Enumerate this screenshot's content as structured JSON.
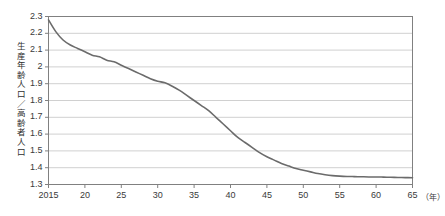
{
  "chart_data": {
    "type": "line",
    "title": "",
    "xlabel": "",
    "ylabel": "生産年齢人口／高齢者人口",
    "x_unit": "（年）",
    "xlim": [
      2015,
      2065
    ],
    "ylim": [
      1.3,
      2.3
    ],
    "grid": true,
    "legend": "none",
    "x_tick_labels": [
      "2015",
      "20",
      "25",
      "30",
      "35",
      "40",
      "45",
      "50",
      "55",
      "60",
      "65"
    ],
    "x_tick_values": [
      2015,
      2020,
      2025,
      2030,
      2035,
      2040,
      2045,
      2050,
      2055,
      2060,
      2065
    ],
    "y_tick_labels": [
      "1.3",
      "1.4",
      "1.5",
      "1.6",
      "1.7",
      "1.8",
      "1.9",
      "2",
      "2.1",
      "2.2",
      "2.3"
    ],
    "y_tick_values": [
      1.3,
      1.4,
      1.5,
      1.6,
      1.7,
      1.8,
      1.9,
      2.0,
      2.1,
      2.2,
      2.3
    ],
    "series": [
      {
        "name": "生産年齢人口／高齢者人口",
        "color": "#6b6b6b",
        "x": [
          2015,
          2016,
          2017,
          2018,
          2019,
          2020,
          2021,
          2022,
          2023,
          2024,
          2025,
          2026,
          2027,
          2028,
          2029,
          2030,
          2031,
          2032,
          2033,
          2034,
          2035,
          2036,
          2037,
          2038,
          2039,
          2040,
          2041,
          2042,
          2043,
          2044,
          2045,
          2046,
          2047,
          2048,
          2049,
          2050,
          2051,
          2052,
          2053,
          2054,
          2055,
          2056,
          2057,
          2058,
          2059,
          2060,
          2061,
          2062,
          2063,
          2064,
          2065
        ],
        "values": [
          2.28,
          2.21,
          2.16,
          2.13,
          2.11,
          2.09,
          2.07,
          2.06,
          2.04,
          2.03,
          2.01,
          1.99,
          1.97,
          1.95,
          1.93,
          1.915,
          1.905,
          1.885,
          1.86,
          1.83,
          1.8,
          1.77,
          1.74,
          1.7,
          1.66,
          1.62,
          1.58,
          1.55,
          1.52,
          1.49,
          1.465,
          1.445,
          1.425,
          1.41,
          1.395,
          1.385,
          1.375,
          1.365,
          1.358,
          1.353,
          1.35,
          1.348,
          1.347,
          1.346,
          1.345,
          1.345,
          1.344,
          1.343,
          1.342,
          1.341,
          1.34
        ]
      }
    ]
  },
  "colors": {
    "line": "#6b6b6b",
    "grid": "#d0d0d0",
    "frame": "#808080",
    "text": "#3a3a3a"
  }
}
